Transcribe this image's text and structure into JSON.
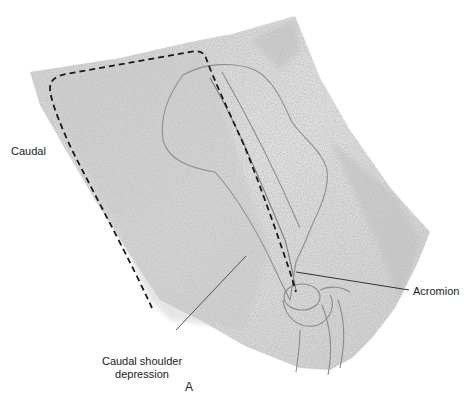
{
  "figure": {
    "panel_letter": "A",
    "labels": {
      "caudal": "Caudal",
      "acromion": "Acromion",
      "caudal_shoulder_depression_line1": "Caudal shoulder",
      "caudal_shoulder_depression_line2": "depression"
    },
    "colors": {
      "background": "#ffffff",
      "skin_light": "#e6e6e6",
      "skin_mid": "#cfcfcf",
      "skin_dark": "#b5b5b5",
      "outline": "#8a8a8a",
      "dashed_boundary": "#1a1a1a",
      "leader_line": "#333333",
      "text": "#222222"
    }
  }
}
